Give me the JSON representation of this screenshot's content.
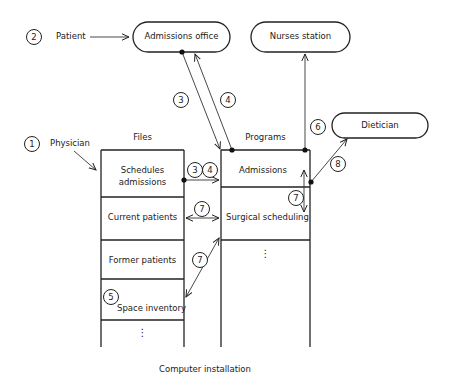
{
  "diagram": {
    "caption": "Computer installation",
    "actors": [
      {
        "number": "1",
        "label": "Physician"
      },
      {
        "number": "2",
        "label": "Patient"
      }
    ],
    "terminals": [
      {
        "id": "admissions_office",
        "label": "Admissions office"
      },
      {
        "id": "nurses_station",
        "label": "Nurses station"
      },
      {
        "id": "dietician",
        "label": "Dietician"
      }
    ],
    "files": {
      "header": "Files",
      "rows": [
        "Schedules admissions",
        "Current patients",
        "Former patients",
        "Space inventory"
      ],
      "row_lines": [
        [
          "Schedules",
          "admissions"
        ],
        [
          "Current patients"
        ],
        [
          "Former patients"
        ],
        [
          "Space inventory"
        ]
      ],
      "continuation": "⋮"
    },
    "programs": {
      "header": "Programs",
      "rows": [
        "Admissions",
        "Surgical scheduling"
      ],
      "continuation": "⋮"
    },
    "flow_numbers": [
      "3",
      "4",
      "3",
      "4",
      "5",
      "6",
      "7",
      "7",
      "7",
      "8"
    ],
    "flows": [
      {
        "num": "2",
        "from": "Patient",
        "to": "Admissions office"
      },
      {
        "num": "3",
        "from": "Admissions office",
        "to": "Admissions"
      },
      {
        "num": "4",
        "from": "Admissions",
        "to": "Admissions office"
      },
      {
        "num": "3 4",
        "from": "Schedules admissions",
        "to": "Admissions"
      },
      {
        "num": "6",
        "from": "Admissions",
        "to": "Nurses station"
      },
      {
        "num": "7",
        "from": "Current patients",
        "to": "Surgical scheduling",
        "bidirectional": true
      },
      {
        "num": "7",
        "from": "Space inventory",
        "to": "Surgical scheduling",
        "bidirectional": true
      },
      {
        "num": "7",
        "from": "Admissions",
        "to": "Surgical scheduling",
        "bidirectional": true
      },
      {
        "num": "8",
        "from": "Admissions",
        "to": "Dietician"
      },
      {
        "num": "1",
        "from": "Physician",
        "to": "Schedules admissions"
      }
    ]
  }
}
